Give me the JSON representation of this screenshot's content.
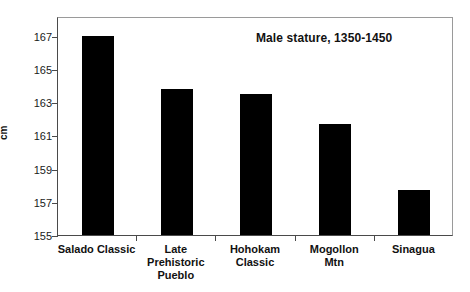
{
  "chart_data": {
    "type": "bar",
    "title": "Male stature, 1350-1450",
    "xlabel": "",
    "ylabel": "cm",
    "categories": [
      "Salado Classic",
      "Late\nPrehistoric\nPueblo",
      "Hohokam\nClassic",
      "Mogollon\nMtn",
      "Sinagua"
    ],
    "values": [
      167.0,
      163.8,
      163.5,
      161.7,
      157.7
    ],
    "ylim": [
      155,
      168.2
    ],
    "yticks": [
      155,
      157,
      159,
      161,
      163,
      165,
      167
    ],
    "ytick_labels": [
      "155",
      "157",
      "159",
      "161",
      "163",
      "165",
      "167"
    ],
    "grid": false,
    "legend": "none",
    "bar_color": "#000000",
    "frame_color": "#4a4a4a"
  },
  "axes": {
    "y_title": "cm"
  }
}
